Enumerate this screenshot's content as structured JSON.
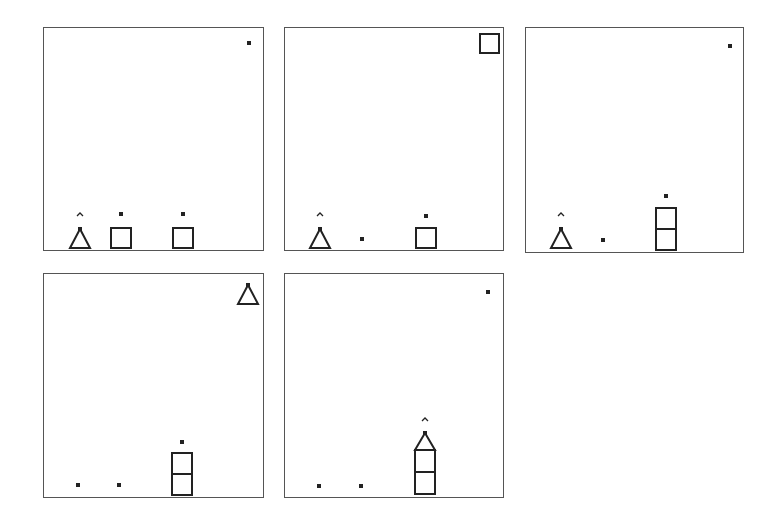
{
  "figure": {
    "stroke_color": "#222222",
    "panels": [
      {
        "id": "panel-1",
        "box": {
          "x": 43,
          "y": 27,
          "w": 221,
          "h": 224
        },
        "objects": [
          {
            "type": "dot",
            "x": 205,
            "y": 15
          },
          {
            "type": "caret",
            "x": 36,
            "y": 186
          },
          {
            "type": "triangle",
            "x": 36,
            "y": 201,
            "w": 20,
            "h": 19
          },
          {
            "type": "dot",
            "x": 77,
            "y": 186
          },
          {
            "type": "square",
            "x": 67,
            "y": 200,
            "w": 20,
            "h": 20
          },
          {
            "type": "dot",
            "x": 139,
            "y": 186
          },
          {
            "type": "square",
            "x": 129,
            "y": 200,
            "w": 20,
            "h": 20
          }
        ]
      },
      {
        "id": "panel-2",
        "box": {
          "x": 284,
          "y": 27,
          "w": 220,
          "h": 224
        },
        "objects": [
          {
            "type": "square",
            "x": 195,
            "y": 6,
            "w": 19,
            "h": 19
          },
          {
            "type": "caret",
            "x": 35,
            "y": 186
          },
          {
            "type": "triangle",
            "x": 35,
            "y": 201,
            "w": 20,
            "h": 19
          },
          {
            "type": "dot",
            "x": 77,
            "y": 211
          },
          {
            "type": "dot",
            "x": 141,
            "y": 188
          },
          {
            "type": "square",
            "x": 131,
            "y": 200,
            "w": 20,
            "h": 20
          }
        ]
      },
      {
        "id": "panel-3",
        "box": {
          "x": 525,
          "y": 27,
          "w": 219,
          "h": 226
        },
        "objects": [
          {
            "type": "dot",
            "x": 204,
            "y": 18
          },
          {
            "type": "caret",
            "x": 35,
            "y": 186
          },
          {
            "type": "triangle",
            "x": 35,
            "y": 201,
            "w": 20,
            "h": 19
          },
          {
            "type": "dot",
            "x": 77,
            "y": 212
          },
          {
            "type": "dot",
            "x": 140,
            "y": 168
          },
          {
            "type": "square",
            "x": 130,
            "y": 180,
            "w": 20,
            "h": 21
          },
          {
            "type": "square",
            "x": 130,
            "y": 201,
            "w": 20,
            "h": 21
          }
        ]
      },
      {
        "id": "panel-4",
        "box": {
          "x": 43,
          "y": 273,
          "w": 221,
          "h": 225
        },
        "objects": [
          {
            "type": "triangle",
            "x": 204,
            "y": 11,
            "w": 20,
            "h": 19
          },
          {
            "type": "dot",
            "x": 34,
            "y": 211
          },
          {
            "type": "dot",
            "x": 75,
            "y": 211
          },
          {
            "type": "dot",
            "x": 138,
            "y": 168
          },
          {
            "type": "square",
            "x": 128,
            "y": 179,
            "w": 20,
            "h": 21
          },
          {
            "type": "square",
            "x": 128,
            "y": 200,
            "w": 20,
            "h": 21
          }
        ]
      },
      {
        "id": "panel-5",
        "box": {
          "x": 284,
          "y": 273,
          "w": 220,
          "h": 225
        },
        "objects": [
          {
            "type": "dot",
            "x": 203,
            "y": 18
          },
          {
            "type": "dot",
            "x": 34,
            "y": 212
          },
          {
            "type": "dot",
            "x": 76,
            "y": 212
          },
          {
            "type": "caret",
            "x": 140,
            "y": 145
          },
          {
            "type": "triangle",
            "x": 140,
            "y": 159,
            "w": 20,
            "h": 17
          },
          {
            "type": "square",
            "x": 130,
            "y": 176,
            "w": 20,
            "h": 22
          },
          {
            "type": "square",
            "x": 130,
            "y": 198,
            "w": 20,
            "h": 22
          }
        ]
      }
    ]
  }
}
